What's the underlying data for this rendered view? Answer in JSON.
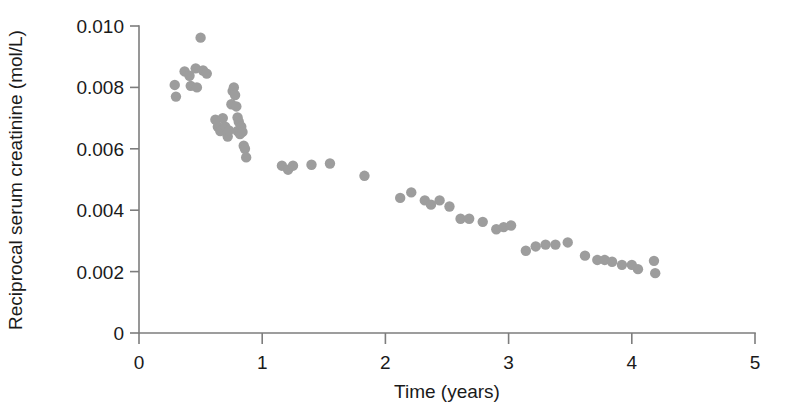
{
  "chart_data": {
    "type": "scatter",
    "title": "",
    "xlabel": "Time (years)",
    "ylabel": "Reciprocal serum creatinine (mol/L)",
    "xlim": [
      0,
      5
    ],
    "ylim": [
      0,
      0.01
    ],
    "xticks": [
      0,
      1,
      2,
      3,
      4,
      5
    ],
    "xticklabels": [
      "0",
      "1",
      "2",
      "3",
      "4",
      "5"
    ],
    "yticks": [
      0,
      0.002,
      0.004,
      0.006,
      0.008,
      0.01
    ],
    "yticklabels": [
      "0",
      "0.002",
      "0.004",
      "0.006",
      "0.008",
      "0.010"
    ],
    "grid": false,
    "legend": null,
    "marker_color": "#9d9d9d",
    "marker_size": 5.2,
    "axis_color": "#7d7d7d",
    "series": [
      {
        "name": "Reciprocal serum creatinine",
        "points": [
          [
            0.29,
            0.00808
          ],
          [
            0.3,
            0.0077
          ],
          [
            0.37,
            0.00852
          ],
          [
            0.41,
            0.00838
          ],
          [
            0.42,
            0.00805
          ],
          [
            0.46,
            0.00862
          ],
          [
            0.47,
            0.008
          ],
          [
            0.5,
            0.00962
          ],
          [
            0.52,
            0.00855
          ],
          [
            0.55,
            0.00845
          ],
          [
            0.62,
            0.00695
          ],
          [
            0.64,
            0.00672
          ],
          [
            0.66,
            0.00658
          ],
          [
            0.68,
            0.007
          ],
          [
            0.7,
            0.00672
          ],
          [
            0.72,
            0.0064
          ],
          [
            0.73,
            0.0066
          ],
          [
            0.75,
            0.00745
          ],
          [
            0.76,
            0.00788
          ],
          [
            0.77,
            0.008
          ],
          [
            0.78,
            0.00775
          ],
          [
            0.79,
            0.00738
          ],
          [
            0.8,
            0.00702
          ],
          [
            0.81,
            0.00688
          ],
          [
            0.8,
            0.00658
          ],
          [
            0.82,
            0.00648
          ],
          [
            0.83,
            0.00672
          ],
          [
            0.84,
            0.00655
          ],
          [
            0.85,
            0.0061
          ],
          [
            0.86,
            0.006
          ],
          [
            0.87,
            0.00572
          ],
          [
            1.16,
            0.00545
          ],
          [
            1.21,
            0.00532
          ],
          [
            1.25,
            0.00545
          ],
          [
            1.4,
            0.00548
          ],
          [
            1.55,
            0.00552
          ],
          [
            1.83,
            0.00512
          ],
          [
            2.12,
            0.0044
          ],
          [
            2.21,
            0.00458
          ],
          [
            2.32,
            0.00432
          ],
          [
            2.37,
            0.00418
          ],
          [
            2.44,
            0.00432
          ],
          [
            2.52,
            0.00412
          ],
          [
            2.61,
            0.00372
          ],
          [
            2.68,
            0.00372
          ],
          [
            2.79,
            0.00362
          ],
          [
            2.9,
            0.00338
          ],
          [
            2.96,
            0.00345
          ],
          [
            3.02,
            0.0035
          ],
          [
            3.14,
            0.00268
          ],
          [
            3.22,
            0.00282
          ],
          [
            3.3,
            0.00288
          ],
          [
            3.38,
            0.00288
          ],
          [
            3.48,
            0.00295
          ],
          [
            3.62,
            0.00252
          ],
          [
            3.72,
            0.00238
          ],
          [
            3.78,
            0.00238
          ],
          [
            3.84,
            0.00232
          ],
          [
            3.92,
            0.00222
          ],
          [
            4.0,
            0.00222
          ],
          [
            4.05,
            0.00208
          ],
          [
            4.18,
            0.00235
          ],
          [
            4.19,
            0.00195
          ]
        ]
      }
    ]
  }
}
